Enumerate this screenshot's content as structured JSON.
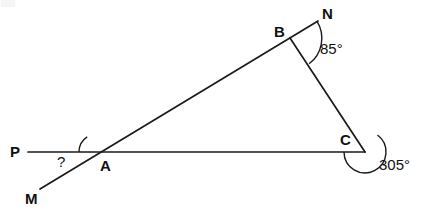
{
  "figure": {
    "kind": "geometry-diagram",
    "background_color": "#ffffff",
    "stroke_color": "#1a1a1a",
    "text_color": "#111111",
    "width": 423,
    "height": 212,
    "points": {
      "P": {
        "label": "P",
        "x": 28,
        "y": 152,
        "label_x": 10,
        "label_y": 144
      },
      "M": {
        "label": "M",
        "x": 40,
        "y": 189,
        "label_x": 25,
        "label_y": 191
      },
      "A": {
        "label": "A",
        "x": 97,
        "y": 152,
        "label_x": 100,
        "label_y": 158
      },
      "B": {
        "label": "B",
        "x": 290,
        "y": 38,
        "label_x": 274,
        "label_y": 24
      },
      "N": {
        "label": "N",
        "x": 318,
        "y": 21,
        "label_x": 322,
        "label_y": 6
      },
      "C": {
        "label": "C",
        "x": 365,
        "y": 152,
        "label_x": 340,
        "label_y": 132
      }
    },
    "segments": [
      {
        "name": "line-PC",
        "from": "P",
        "to": "C"
      },
      {
        "name": "line-MN",
        "from": "M",
        "to": "N"
      },
      {
        "name": "line-BC",
        "from": "B",
        "to": "C"
      }
    ],
    "angles": [
      {
        "name": "angle-at-A",
        "vertex": "A",
        "value": "?",
        "label_x": 57,
        "label_y": 154,
        "arc_radius": 18
      },
      {
        "name": "angle-at-B",
        "vertex": "B",
        "value": "85°",
        "label_x": 320,
        "label_y": 41,
        "arc_radius": 32
      },
      {
        "name": "angle-at-C",
        "vertex": "C",
        "value": "305°",
        "label_x": 379,
        "label_y": 157,
        "arc_radius": 21,
        "reflex": true
      }
    ]
  }
}
